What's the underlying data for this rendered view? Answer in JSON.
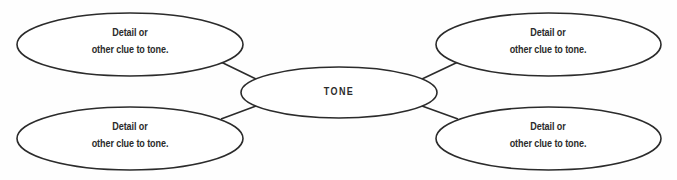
{
  "diagram": {
    "type": "web-organizer",
    "center": {
      "label": "TONE"
    },
    "nodes": [
      {
        "position": "top-left",
        "line1": "Detail or",
        "line2": "other clue to tone."
      },
      {
        "position": "bottom-left",
        "line1": "Detail or",
        "line2": "other clue to tone."
      },
      {
        "position": "top-right",
        "line1": "Detail or",
        "line2": "other clue to tone."
      },
      {
        "position": "bottom-right",
        "line1": "Detail or",
        "line2": "other clue to tone."
      }
    ],
    "colors": {
      "stroke": "#2b2b2b",
      "fill": "#ffffff",
      "text": "#2b2b2b"
    }
  }
}
